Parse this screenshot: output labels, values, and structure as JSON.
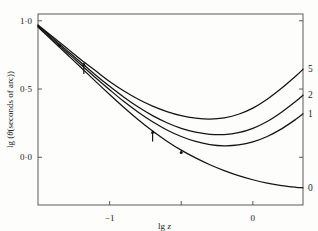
{
  "chart_data": {
    "type": "line",
    "title": "",
    "xlabel": "lg z",
    "ylabel": "lg (θ(seconds of arc))",
    "xlim": [
      -1.5,
      0.35
    ],
    "ylim": [
      -0.35,
      1.05
    ],
    "grid": false,
    "legend_position": "right-inline-curve-labels",
    "x_ticks": [
      {
        "value": -1,
        "label": "−1"
      },
      {
        "value": -0.5,
        "label": ""
      },
      {
        "value": 0,
        "label": "0"
      }
    ],
    "y_ticks": [
      {
        "value": 1.0,
        "label": "1·0"
      },
      {
        "value": 0.5,
        "label": "0·5"
      },
      {
        "value": 0.0,
        "label": "0·0"
      }
    ],
    "series": [
      {
        "name": "5",
        "label": "5",
        "points": [
          [
            -1.5,
            0.97
          ],
          [
            -1.4,
            0.885
          ],
          [
            -1.3,
            0.8
          ],
          [
            -1.2,
            0.715
          ],
          [
            -1.1,
            0.635
          ],
          [
            -1.0,
            0.555
          ],
          [
            -0.9,
            0.485
          ],
          [
            -0.8,
            0.425
          ],
          [
            -0.7,
            0.375
          ],
          [
            -0.6,
            0.335
          ],
          [
            -0.5,
            0.305
          ],
          [
            -0.4,
            0.287
          ],
          [
            -0.3,
            0.28
          ],
          [
            -0.2,
            0.288
          ],
          [
            -0.1,
            0.315
          ],
          [
            0.0,
            0.36
          ],
          [
            0.1,
            0.425
          ],
          [
            0.2,
            0.505
          ],
          [
            0.3,
            0.595
          ],
          [
            0.35,
            0.645
          ]
        ]
      },
      {
        "name": "2",
        "label": "2",
        "points": [
          [
            -1.5,
            0.965
          ],
          [
            -1.4,
            0.875
          ],
          [
            -1.3,
            0.785
          ],
          [
            -1.2,
            0.695
          ],
          [
            -1.1,
            0.605
          ],
          [
            -1.0,
            0.52
          ],
          [
            -0.9,
            0.44
          ],
          [
            -0.8,
            0.368
          ],
          [
            -0.7,
            0.305
          ],
          [
            -0.6,
            0.253
          ],
          [
            -0.5,
            0.212
          ],
          [
            -0.4,
            0.184
          ],
          [
            -0.3,
            0.168
          ],
          [
            -0.2,
            0.166
          ],
          [
            -0.1,
            0.18
          ],
          [
            0.0,
            0.212
          ],
          [
            0.1,
            0.262
          ],
          [
            0.2,
            0.33
          ],
          [
            0.3,
            0.41
          ],
          [
            0.35,
            0.455
          ]
        ]
      },
      {
        "name": "1",
        "label": "1",
        "points": [
          [
            -1.5,
            0.96
          ],
          [
            -1.4,
            0.866
          ],
          [
            -1.3,
            0.772
          ],
          [
            -1.2,
            0.678
          ],
          [
            -1.1,
            0.585
          ],
          [
            -1.0,
            0.495
          ],
          [
            -0.9,
            0.408
          ],
          [
            -0.8,
            0.33
          ],
          [
            -0.7,
            0.26
          ],
          [
            -0.6,
            0.2
          ],
          [
            -0.5,
            0.152
          ],
          [
            -0.4,
            0.116
          ],
          [
            -0.3,
            0.093
          ],
          [
            -0.2,
            0.084
          ],
          [
            -0.1,
            0.09
          ],
          [
            0.0,
            0.112
          ],
          [
            0.1,
            0.152
          ],
          [
            0.2,
            0.208
          ],
          [
            0.3,
            0.278
          ],
          [
            0.35,
            0.318
          ]
        ]
      },
      {
        "name": "0",
        "label": "0",
        "points": [
          [
            -1.5,
            0.955
          ],
          [
            -1.4,
            0.856
          ],
          [
            -1.3,
            0.757
          ],
          [
            -1.2,
            0.658
          ],
          [
            -1.1,
            0.558
          ],
          [
            -1.0,
            0.46
          ],
          [
            -0.9,
            0.365
          ],
          [
            -0.8,
            0.275
          ],
          [
            -0.7,
            0.192
          ],
          [
            -0.6,
            0.118
          ],
          [
            -0.5,
            0.052
          ],
          [
            -0.4,
            -0.005
          ],
          [
            -0.3,
            -0.055
          ],
          [
            -0.2,
            -0.098
          ],
          [
            -0.1,
            -0.135
          ],
          [
            0.0,
            -0.165
          ],
          [
            0.1,
            -0.19
          ],
          [
            0.2,
            -0.208
          ],
          [
            0.3,
            -0.22
          ],
          [
            0.35,
            -0.224
          ]
        ]
      }
    ],
    "annotations": [
      {
        "kind": "arrow-up",
        "x": -1.18,
        "y": 0.655
      },
      {
        "kind": "arrow-up",
        "x": -0.7,
        "y": 0.16
      },
      {
        "kind": "dot",
        "x": -0.5,
        "y": 0.035
      },
      {
        "kind": "dot",
        "x": -1.35,
        "y": 0.82
      }
    ]
  },
  "axes": {
    "x_title": "lg z",
    "x_title_italic_part": "z",
    "y_title": "lg (θ(seconds of arc))"
  }
}
